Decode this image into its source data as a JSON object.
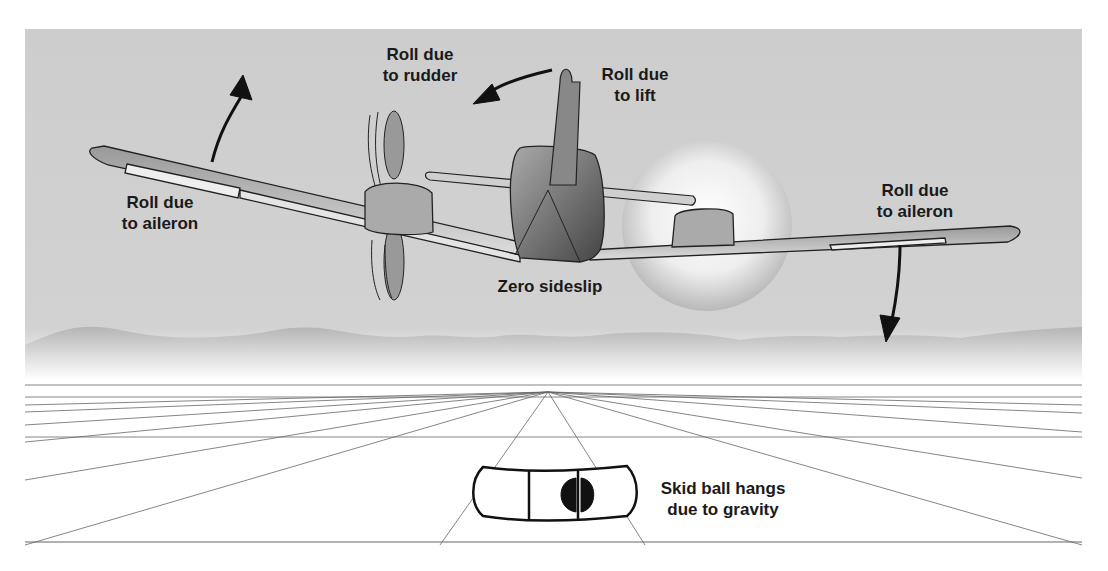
{
  "labels": {
    "roll_rudder": {
      "line1": "Roll due",
      "line2": "to rudder"
    },
    "roll_lift": {
      "line1": "Roll due",
      "line2": "to lift"
    },
    "roll_aileron_left": {
      "line1": "Roll due",
      "line2": "to aileron"
    },
    "roll_aileron_right": {
      "line1": "Roll due",
      "line2": "to aileron"
    },
    "zero_sideslip": "Zero sideslip",
    "skid_ball": {
      "line1": "Skid ball hangs",
      "line2": "due to gravity"
    }
  },
  "colors": {
    "sky": "#cfcfcf",
    "hills": "#bdbdbd",
    "ground": "#ffffff",
    "lines": "#555555",
    "ink": "#1a1a1a"
  }
}
